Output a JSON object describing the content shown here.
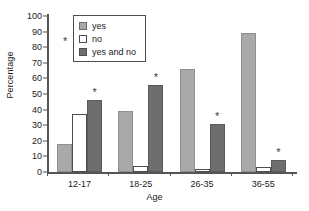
{
  "chart_data": {
    "type": "bar",
    "title": "",
    "xlabel": "Age",
    "ylabel": "Percentage",
    "categories": [
      "12-17",
      "18-25",
      "26-35",
      "36-55"
    ],
    "series": [
      {
        "name": "yes",
        "color": "#a9a9a9",
        "values": [
          18,
          39,
          66,
          89
        ]
      },
      {
        "name": "no",
        "color": "#ffffff",
        "values": [
          37,
          4,
          2,
          3
        ]
      },
      {
        "name": "yes and no",
        "color": "#6e6e6e",
        "values": [
          46,
          56,
          31,
          8
        ]
      }
    ],
    "ylim": [
      0,
      100
    ],
    "yticks": [
      0,
      10,
      20,
      30,
      40,
      50,
      60,
      70,
      80,
      90,
      100
    ],
    "grid": false,
    "legend_position": "top-left-inside",
    "annotations": [
      {
        "marker": "*",
        "series": "yes and no",
        "category": "12-17"
      },
      {
        "marker": "*",
        "series": "yes and no",
        "category": "18-25"
      },
      {
        "marker": "*",
        "series": "yes and no",
        "category": "26-35"
      },
      {
        "marker": "*",
        "series": "yes and no",
        "category": "36-55"
      },
      {
        "marker": "*",
        "target": "legend"
      }
    ],
    "marker_glyph": "*"
  }
}
